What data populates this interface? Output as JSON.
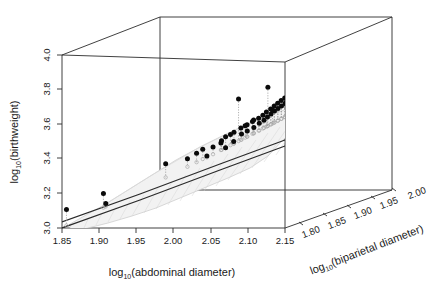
{
  "figure": {
    "kind": "3d-scatter-with-surface",
    "background": "#ffffff",
    "point_color": "#0a0a0a",
    "projection_color": "#a8a8a8",
    "surface_fill": "#f2f2f2",
    "surface_edge": "#c9c9c9",
    "fit_line_color": "#2b2b2b",
    "axis_color": "#2b2b2b"
  },
  "axes": {
    "x": {
      "label_parts": {
        "prefix": "log",
        "sub": "10",
        "suffix": "(abdominal diameter)"
      },
      "label": "log10(abdominal diameter)",
      "ticks": [
        "1.85",
        "1.90",
        "1.95",
        "2.00",
        "2.05",
        "2.10",
        "2.15"
      ],
      "range": [
        1.85,
        2.15
      ]
    },
    "y": {
      "label_parts": {
        "prefix": "log",
        "sub": "10",
        "suffix": "(birthweight)"
      },
      "label": "log10(birthweight)",
      "ticks": [
        "3.0",
        "3.2",
        "3.4",
        "3.6",
        "3.8",
        "4.0"
      ],
      "range": [
        3.0,
        4.0
      ]
    },
    "z": {
      "label_parts": {
        "prefix": "log",
        "sub": "10",
        "suffix": "(biparietal diameter)"
      },
      "label": "log10(biparietal diameter)",
      "ticks": [
        "1.80",
        "1.85",
        "1.90",
        "1.95",
        "2.00"
      ],
      "range": [
        1.78,
        2.01
      ]
    }
  },
  "chart_data": {
    "type": "scatter",
    "title": "",
    "xlabel": "log10(abdominal diameter)",
    "ylabel": "log10(birthweight)",
    "zlabel": "log10(biparietal diameter)",
    "xlim": [
      1.85,
      2.15
    ],
    "ylim": [
      3.0,
      4.0
    ],
    "zlim": [
      1.78,
      2.01
    ],
    "grid": false,
    "legend": "none",
    "series": [
      {
        "name": "observations",
        "marker": "filled-circle",
        "color": "#0a0a0a",
        "points": [
          {
            "x": 1.852,
            "y": 3.1,
            "z": 1.787
          },
          {
            "x": 1.9,
            "y": 3.19,
            "z": 1.79
          },
          {
            "x": 1.902,
            "y": 3.13,
            "z": 1.792
          },
          {
            "x": 1.978,
            "y": 3.352,
            "z": 1.8
          },
          {
            "x": 2.021,
            "y": 3.425,
            "z": 1.812
          },
          {
            "x": 2.03,
            "y": 3.392,
            "z": 1.806
          },
          {
            "x": 2.042,
            "y": 3.455,
            "z": 1.818
          },
          {
            "x": 2.046,
            "y": 3.488,
            "z": 1.822
          },
          {
            "x": 2.05,
            "y": 3.43,
            "z": 1.815
          },
          {
            "x": 2.055,
            "y": 3.51,
            "z": 1.826
          },
          {
            "x": 2.058,
            "y": 3.462,
            "z": 1.82
          },
          {
            "x": 2.062,
            "y": 3.53,
            "z": 1.83
          },
          {
            "x": 2.064,
            "y": 3.498,
            "z": 1.828
          },
          {
            "x": 2.068,
            "y": 3.545,
            "z": 1.834
          },
          {
            "x": 2.07,
            "y": 3.512,
            "z": 1.831
          },
          {
            "x": 2.073,
            "y": 3.56,
            "z": 1.838
          },
          {
            "x": 2.076,
            "y": 3.528,
            "z": 1.836
          },
          {
            "x": 2.079,
            "y": 3.575,
            "z": 1.842
          },
          {
            "x": 2.081,
            "y": 3.548,
            "z": 1.84
          },
          {
            "x": 2.083,
            "y": 3.59,
            "z": 1.845
          },
          {
            "x": 2.085,
            "y": 3.562,
            "z": 1.844
          },
          {
            "x": 2.086,
            "y": 3.605,
            "z": 1.848
          },
          {
            "x": 2.088,
            "y": 3.578,
            "z": 1.847
          },
          {
            "x": 2.09,
            "y": 3.62,
            "z": 1.851
          },
          {
            "x": 2.091,
            "y": 3.592,
            "z": 1.85
          },
          {
            "x": 2.093,
            "y": 3.635,
            "z": 1.854
          },
          {
            "x": 2.094,
            "y": 3.606,
            "z": 1.853
          },
          {
            "x": 2.096,
            "y": 3.648,
            "z": 1.857
          },
          {
            "x": 2.097,
            "y": 3.618,
            "z": 1.856
          },
          {
            "x": 2.099,
            "y": 3.66,
            "z": 1.86
          },
          {
            "x": 2.1,
            "y": 3.63,
            "z": 1.859
          },
          {
            "x": 2.102,
            "y": 3.672,
            "z": 1.863
          },
          {
            "x": 2.103,
            "y": 3.642,
            "z": 1.862
          },
          {
            "x": 2.105,
            "y": 3.684,
            "z": 1.866
          },
          {
            "x": 2.106,
            "y": 3.654,
            "z": 1.865
          },
          {
            "x": 2.108,
            "y": 3.695,
            "z": 1.869
          },
          {
            "x": 2.109,
            "y": 3.666,
            "z": 1.868
          },
          {
            "x": 2.111,
            "y": 3.706,
            "z": 1.872
          },
          {
            "x": 2.112,
            "y": 3.677,
            "z": 1.871
          },
          {
            "x": 2.114,
            "y": 3.717,
            "z": 1.875
          },
          {
            "x": 2.115,
            "y": 3.688,
            "z": 1.874
          },
          {
            "x": 2.117,
            "y": 3.727,
            "z": 1.878
          },
          {
            "x": 2.118,
            "y": 3.699,
            "z": 1.877
          },
          {
            "x": 2.12,
            "y": 3.737,
            "z": 1.881
          },
          {
            "x": 2.121,
            "y": 3.71,
            "z": 1.88
          },
          {
            "x": 2.123,
            "y": 3.748,
            "z": 1.884
          },
          {
            "x": 2.124,
            "y": 3.72,
            "z": 1.883
          },
          {
            "x": 2.126,
            "y": 3.758,
            "z": 1.887
          },
          {
            "x": 2.128,
            "y": 3.731,
            "z": 1.886
          },
          {
            "x": 2.13,
            "y": 3.77,
            "z": 1.89
          },
          {
            "x": 2.132,
            "y": 3.742,
            "z": 1.889
          },
          {
            "x": 2.134,
            "y": 3.782,
            "z": 1.893
          },
          {
            "x": 2.136,
            "y": 3.754,
            "z": 1.892
          },
          {
            "x": 2.139,
            "y": 3.795,
            "z": 1.897
          },
          {
            "x": 2.141,
            "y": 3.766,
            "z": 1.896
          },
          {
            "x": 2.144,
            "y": 3.808,
            "z": 1.901
          },
          {
            "x": 2.146,
            "y": 3.778,
            "z": 1.9
          },
          {
            "x": 2.149,
            "y": 3.822,
            "z": 1.905
          },
          {
            "x": 2.06,
            "y": 3.7,
            "z": 1.828
          },
          {
            "x": 2.088,
            "y": 3.748,
            "z": 1.848
          },
          {
            "x": 2.118,
            "y": 3.802,
            "z": 1.878
          },
          {
            "x": 2.136,
            "y": 3.86,
            "z": 1.893
          },
          {
            "x": 2.036,
            "y": 3.44,
            "z": 1.81
          },
          {
            "x": 2.044,
            "y": 3.47,
            "z": 1.816
          },
          {
            "x": 2.052,
            "y": 3.5,
            "z": 1.823
          },
          {
            "x": 2.066,
            "y": 3.54,
            "z": 1.833
          },
          {
            "x": 2.074,
            "y": 3.568,
            "z": 1.839
          },
          {
            "x": 2.092,
            "y": 3.612,
            "z": 1.852
          },
          {
            "x": 2.104,
            "y": 3.65,
            "z": 1.864
          },
          {
            "x": 2.11,
            "y": 3.69,
            "z": 1.87
          },
          {
            "x": 2.127,
            "y": 3.744,
            "z": 1.888
          },
          {
            "x": 2.143,
            "y": 3.79,
            "z": 1.899
          },
          {
            "x": 2.005,
            "y": 3.378,
            "z": 1.804
          },
          {
            "x": 2.015,
            "y": 3.405,
            "z": 1.808
          }
        ]
      },
      {
        "name": "surface-projections",
        "marker": "open-circle",
        "color": "#a8a8a8",
        "note": "each observation dropped vertically onto the fitted surface"
      }
    ],
    "surface": {
      "name": "fitted regression surface",
      "style": "shaded band with hatching",
      "front_edge_style": "solid dark curve"
    }
  }
}
